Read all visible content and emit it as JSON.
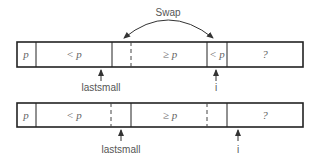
{
  "diagram": {
    "swap_label": "Swap",
    "row1": {
      "cells": [
        "p",
        "< p",
        "≥ p",
        "< p",
        "?"
      ],
      "pointers": [
        {
          "label": "lastsmall",
          "x": 101
        },
        {
          "label": "i",
          "x": 216
        }
      ]
    },
    "row2": {
      "cells": [
        "p",
        "< p",
        "≥ p",
        "?"
      ],
      "pointers": [
        {
          "label": "lastsmall",
          "x": 121
        },
        {
          "label": "i",
          "x": 238
        }
      ]
    },
    "colors": {
      "line": "#222222",
      "text": "#555555"
    }
  }
}
